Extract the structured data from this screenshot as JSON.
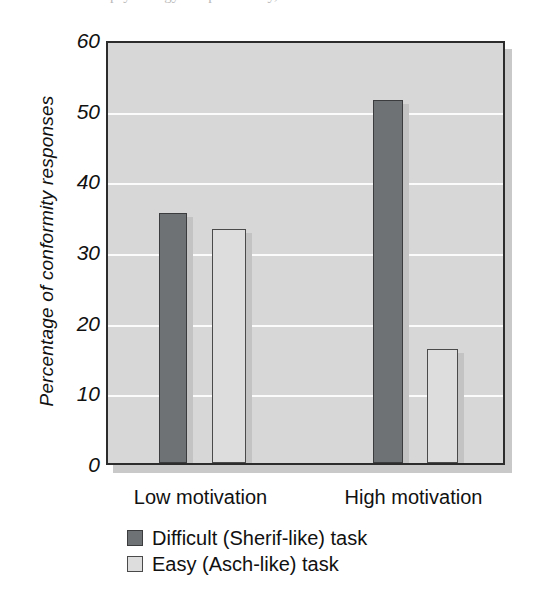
{
  "scan": {
    "top_sliver_text": "psychology and personality, 3rd edition"
  },
  "chart_data": {
    "type": "bar",
    "title": "",
    "xlabel": "",
    "ylabel": "Percentage of conformity responses",
    "categories": [
      "Low motivation",
      "High motivation"
    ],
    "series": [
      {
        "name": "Difficult (Sherif-like) task",
        "color": "#6f7275",
        "values": [
          35.4,
          51.4
        ]
      },
      {
        "name": "Easy (Asch-like) task",
        "color": "#dddddd",
        "values": [
          33.1,
          16.1
        ]
      }
    ],
    "ylim": [
      0,
      60
    ],
    "yticks": [
      0,
      10,
      20,
      30,
      40,
      50,
      60
    ],
    "ytick_labels": [
      "0",
      "10",
      "20",
      "30",
      "40",
      "50",
      "60"
    ],
    "grid": "horizontal",
    "grid_color": "#fbfbfb",
    "plot_background": "#d7d7d7",
    "legend_position": "below-axes-left"
  },
  "axis": {
    "y_title": "Percentage of conformity responses"
  },
  "legend": {
    "items": [
      {
        "label": "Difficult (Sherif-like) task",
        "swatch": "dark"
      },
      {
        "label": "Easy (Asch-like) task",
        "swatch": "light"
      }
    ]
  }
}
